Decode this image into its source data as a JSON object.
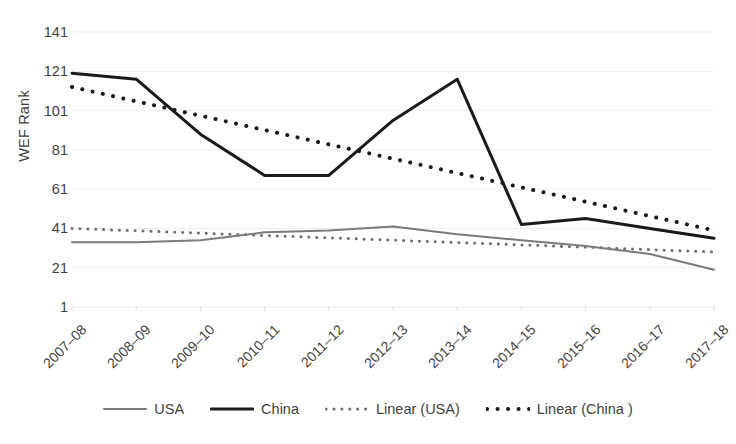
{
  "chart_data": {
    "type": "line",
    "title": "",
    "xlabel": "",
    "ylabel": "WEF Rank",
    "ylim": [
      1,
      141
    ],
    "yticks": [
      1,
      21,
      41,
      61,
      81,
      101,
      121,
      141
    ],
    "grid": true,
    "legend_position": "bottom",
    "categories": [
      "2007–08",
      "2008–09",
      "2009–10",
      "2010–11",
      "2011–12",
      "2012–13",
      "2013–14",
      "2014–15",
      "2015–16",
      "2016–17",
      "2017–18"
    ],
    "series": [
      {
        "name": "USA",
        "style": "solid",
        "color": "#7a7a7a",
        "width": 2,
        "values": [
          34,
          34,
          35,
          39,
          40,
          42,
          38,
          35,
          32,
          28,
          20
        ]
      },
      {
        "name": "China",
        "style": "solid",
        "color": "#1a1a1a",
        "width": 3,
        "values": [
          120,
          117,
          89,
          68,
          68,
          96,
          117,
          43,
          46,
          41,
          36
        ]
      },
      {
        "name": "Linear (USA)",
        "style": "dotted",
        "color": "#6f6f6f",
        "width": 3,
        "values": [
          41,
          39.8,
          38.6,
          37.4,
          36.2,
          35,
          33.8,
          32.6,
          31.4,
          30.2,
          29
        ]
      },
      {
        "name": "Linear (China )",
        "style": "dotted",
        "color": "#1a1a1a",
        "width": 4,
        "values": [
          113,
          105.7,
          98.4,
          91.1,
          83.8,
          76.5,
          69.2,
          61.9,
          54.6,
          47.3,
          40
        ]
      }
    ]
  },
  "legend": {
    "items": [
      {
        "label": "USA",
        "swatch": "solid-gray-line"
      },
      {
        "label": "China",
        "swatch": "solid-black-line"
      },
      {
        "label": "Linear (USA)",
        "swatch": "dotted-gray-line"
      },
      {
        "label": "Linear (China )",
        "swatch": "dotted-black-line"
      }
    ]
  },
  "colors": {
    "usa": "#7a7a7a",
    "china": "#1a1a1a",
    "grid": "#ededed",
    "text": "#3f3f3f",
    "background": "#ffffff"
  }
}
